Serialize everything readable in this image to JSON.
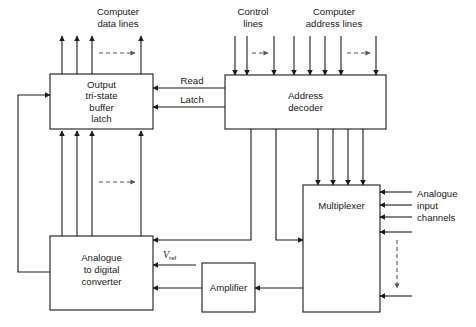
{
  "diagram": {
    "stroke_color": "#1a1a1a",
    "dashed_color": "#55565a",
    "background": "#ffffff"
  },
  "blocks": {
    "output_buffer": {
      "line1": "Output",
      "line2": "tri-state",
      "line3": "buffer",
      "line4": "latch"
    },
    "address_decoder": {
      "line1": "Address",
      "line2": "decoder"
    },
    "multiplexer": {
      "line1": "Multiplexer"
    },
    "adc": {
      "line1": "Analogue",
      "line2": "to digital",
      "line3": "converter"
    },
    "amplifier": {
      "line1": "Amplifier"
    }
  },
  "labels": {
    "computer_data_lines": {
      "line1": "Computer",
      "line2": "data lines"
    },
    "control_lines": {
      "line1": "Control",
      "line2": "lines"
    },
    "computer_address_lines": {
      "line1": "Computer",
      "line2": "address lines"
    },
    "analogue_input_channels": {
      "line1": "Analogue",
      "line2": "input",
      "line3": "channels"
    },
    "read": "Read",
    "latch": "Latch",
    "vref_symbol": "V",
    "vref_subscript": "ref"
  },
  "bus_counts": {
    "computer_data_lines": 4,
    "control_lines": 3,
    "computer_address_lines": 6,
    "decoder_to_multiplexer": 4,
    "adc_to_buffer": 4,
    "analogue_input_channels": 5
  }
}
